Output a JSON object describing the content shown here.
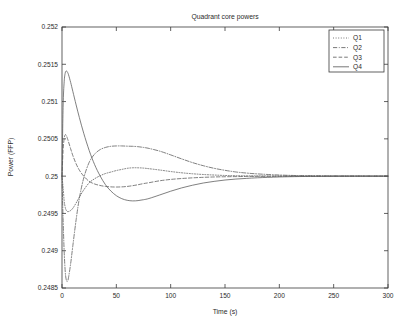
{
  "chart_data": {
    "type": "line",
    "title": "Quadrant core powers",
    "xlabel": "Time (s)",
    "ylabel": "Power (FFP)",
    "xlim": [
      0,
      300
    ],
    "ylim": [
      0.2485,
      0.252
    ],
    "grid": false,
    "legend_position": "top-right",
    "xticks": [
      0,
      50,
      100,
      150,
      200,
      250,
      300
    ],
    "xtick_labels": [
      "0",
      "50",
      "100",
      "150",
      "200",
      "250",
      "300"
    ],
    "yticks": [
      0.2485,
      0.249,
      0.2495,
      0.25,
      0.2505,
      0.251,
      0.2515,
      0.252
    ],
    "ytick_labels": [
      "0.2485",
      "0.249",
      "0.2495",
      "0.25",
      "0.2505",
      "0.251",
      "0.2515",
      "0.252"
    ],
    "line_color": "#555555",
    "series": [
      {
        "name": "Q1",
        "style": "dotted",
        "dasharray": "1,1.6",
        "x": [
          0,
          1,
          2,
          3,
          4,
          5,
          6,
          8,
          10,
          13,
          16,
          20,
          25,
          30,
          35,
          40,
          45,
          50,
          55,
          60,
          65,
          70,
          75,
          80,
          90,
          100,
          110,
          120,
          130,
          140,
          150,
          160,
          170,
          180,
          200,
          220,
          250,
          275,
          300
        ],
        "values": [
          0.25,
          0.24985,
          0.24967,
          0.24958,
          0.24954,
          0.249525,
          0.249525,
          0.24954,
          0.24957,
          0.24964,
          0.24972,
          0.249815,
          0.24991,
          0.249965,
          0.250005,
          0.250035,
          0.250055,
          0.250075,
          0.25009,
          0.250105,
          0.250112,
          0.250112,
          0.250108,
          0.2501,
          0.250082,
          0.250062,
          0.250045,
          0.250032,
          0.250022,
          0.250015,
          0.250009,
          0.250006,
          0.250004,
          0.250003,
          0.250001,
          0.25,
          0.25,
          0.25,
          0.25
        ]
      },
      {
        "name": "Q2",
        "style": "dashdot",
        "dasharray": "4.2,1.6,0.9,1.6",
        "x": [
          0,
          1,
          2,
          3,
          4,
          5,
          6,
          8,
          10,
          13,
          16,
          20,
          25,
          30,
          35,
          40,
          45,
          50,
          55,
          60,
          65,
          70,
          75,
          80,
          90,
          100,
          110,
          120,
          130,
          140,
          150,
          160,
          170,
          180,
          200,
          220,
          250,
          275,
          300
        ],
        "values": [
          0.25,
          0.24943,
          0.24899,
          0.248715,
          0.248605,
          0.24859,
          0.24864,
          0.24883,
          0.24907,
          0.249415,
          0.249705,
          0.249975,
          0.250185,
          0.250295,
          0.250355,
          0.250385,
          0.2504,
          0.250405,
          0.250405,
          0.250402,
          0.2504,
          0.250395,
          0.250385,
          0.250372,
          0.250335,
          0.250285,
          0.250232,
          0.250182,
          0.25014,
          0.250105,
          0.250078,
          0.250056,
          0.250041,
          0.25003,
          0.250015,
          0.250007,
          0.250002,
          0.250001,
          0.25
        ]
      },
      {
        "name": "Q3",
        "style": "dashed",
        "dasharray": "3.6,2.0",
        "x": [
          0,
          1,
          2,
          3,
          4,
          5,
          6,
          8,
          10,
          13,
          16,
          20,
          25,
          30,
          35,
          40,
          45,
          50,
          55,
          60,
          65,
          70,
          75,
          80,
          90,
          100,
          110,
          120,
          130,
          140,
          150,
          160,
          170,
          180,
          200,
          220,
          250,
          275,
          300
        ],
        "values": [
          0.25,
          0.250345,
          0.250505,
          0.250555,
          0.250545,
          0.250505,
          0.25046,
          0.250365,
          0.250275,
          0.250165,
          0.25008,
          0.25,
          0.24993,
          0.249895,
          0.249875,
          0.249862,
          0.249856,
          0.249854,
          0.249856,
          0.249862,
          0.249872,
          0.249885,
          0.2499,
          0.249912,
          0.249938,
          0.249956,
          0.249968,
          0.249977,
          0.249984,
          0.249989,
          0.249992,
          0.249994,
          0.249996,
          0.249997,
          0.249999,
          0.25,
          0.25,
          0.25,
          0.25
        ]
      },
      {
        "name": "Q4",
        "style": "solid",
        "dasharray": "none",
        "x": [
          0,
          1,
          2,
          3,
          4,
          5,
          6,
          8,
          10,
          13,
          16,
          20,
          25,
          30,
          35,
          40,
          45,
          50,
          55,
          60,
          65,
          70,
          75,
          80,
          90,
          100,
          110,
          120,
          130,
          140,
          150,
          160,
          170,
          180,
          200,
          220,
          250,
          275,
          300
        ],
        "values": [
          0.25,
          0.25092,
          0.251265,
          0.251385,
          0.25141,
          0.251395,
          0.25136,
          0.251255,
          0.251135,
          0.250955,
          0.250785,
          0.250575,
          0.250345,
          0.250155,
          0.250005,
          0.249885,
          0.2498,
          0.249738,
          0.249698,
          0.249676,
          0.249668,
          0.249672,
          0.249684,
          0.2497,
          0.249748,
          0.249798,
          0.249842,
          0.249878,
          0.249908,
          0.24993,
          0.249948,
          0.249961,
          0.24997,
          0.249978,
          0.249989,
          0.249995,
          0.249999,
          0.25,
          0.25
        ]
      }
    ]
  },
  "legend": {
    "entries": [
      "Q1",
      "Q2",
      "Q3",
      "Q4"
    ]
  }
}
